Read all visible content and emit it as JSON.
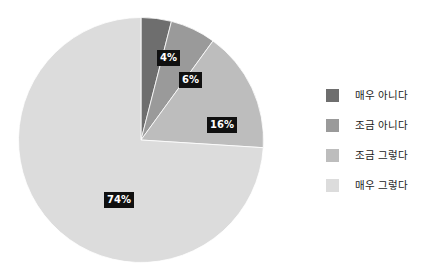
{
  "chart_data": {
    "type": "pie",
    "title": "",
    "subtitle": "",
    "xlabel": "",
    "ylabel": "",
    "grid": false,
    "legend_position": "right",
    "start_angle_deg": 0,
    "direction": "clockwise",
    "categories": [
      "매우 아니다",
      "조금 아니다",
      "조금 그렇다",
      "매우 그렇다"
    ],
    "values": [
      4,
      6,
      16,
      74
    ],
    "value_unit": "%",
    "data_labels": [
      "4%",
      "6%",
      "16%",
      "74%"
    ],
    "slice_colors": [
      "#6e6e6e",
      "#9a9a9a",
      "#bdbdbd",
      "#dcdcdc"
    ],
    "slice_stroke": "#ffffff",
    "data_label_bg": "#101010",
    "data_label_color": "#ffffff"
  },
  "legend": {
    "items": [
      {
        "label": "매우 아니다",
        "color": "#6e6e6e"
      },
      {
        "label": "조금 아니다",
        "color": "#9a9a9a"
      },
      {
        "label": "조금 그렇다",
        "color": "#bdbdbd"
      },
      {
        "label": "매우 그렇다",
        "color": "#dcdcdc"
      }
    ]
  },
  "canvas": {
    "background": "#ffffff"
  }
}
